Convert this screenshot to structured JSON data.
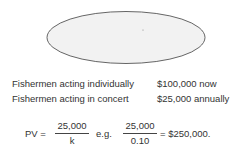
{
  "diagram": {
    "ellipse": {
      "cx": 126,
      "cy": 37.5,
      "rx": 79,
      "ry": 26,
      "fill": "#f2f2f2",
      "stroke": "#555555"
    },
    "rows": [
      {
        "label": "Fishermen acting individually",
        "value": "$100,000 now"
      },
      {
        "label": "Fishermen acting in concert",
        "value": "$25,000 annually"
      }
    ],
    "formula": {
      "lhs": "PV =",
      "frac1": {
        "numerator": "25,000",
        "denominator": "k"
      },
      "eg": "e.g.",
      "frac2": {
        "numerator": "25,000",
        "denominator": "0.10"
      },
      "result": "= $250,000."
    }
  }
}
